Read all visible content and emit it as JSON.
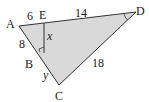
{
  "figure": {
    "type": "geometry",
    "shading_color": "#d9d9d9",
    "line_color": "#333333",
    "points": {
      "A": {
        "label": "A",
        "x": 19,
        "y": 26
      },
      "E": {
        "label": "E",
        "x": 44,
        "y": 23
      },
      "D": {
        "label": "D",
        "x": 136,
        "y": 12
      },
      "B": {
        "label": "B",
        "x": 37,
        "y": 55
      },
      "C": {
        "label": "C",
        "x": 59,
        "y": 85
      }
    },
    "segment_labels": {
      "AE": "6",
      "ED": "14",
      "AB": "8",
      "EF": "x",
      "BC": "y",
      "CD": "18"
    }
  }
}
